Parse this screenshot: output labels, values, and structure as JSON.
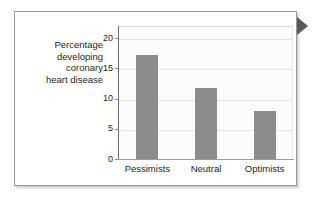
{
  "figure": {
    "caption_lines": "Percentage\ndeveloping\ncoronary\nheart disease",
    "pointer_marker": "play-triangle-icon"
  },
  "colors": {
    "bar_fill": "#8c8c8c",
    "frame_border": "#9a9a9a",
    "gridline": "#e4e4e4",
    "axis": "#6f6f6f",
    "text": "#231f20",
    "pointer": "#595959",
    "plot_background": "#fcfcfc"
  },
  "chart_data": {
    "type": "bar",
    "title": "",
    "subtitle": "",
    "xlabel": "",
    "ylabel": "Percentage developing coronary heart disease",
    "categories": [
      "Pessimists",
      "Neutral",
      "Optimists"
    ],
    "values": [
      17.2,
      11.7,
      7.9
    ],
    "ylim": [
      0,
      22
    ],
    "yticks": [
      0,
      5,
      10,
      15,
      20
    ],
    "ytick_labels": [
      "0",
      "5",
      "10",
      "15",
      "20"
    ],
    "grid": true,
    "grid_axis": "y",
    "legend": false,
    "legend_position": "none",
    "series": [
      {
        "name": "Percentage developing coronary heart disease",
        "values": [
          17.2,
          11.7,
          7.9
        ],
        "color": "#8c8c8c"
      }
    ],
    "annotations": []
  }
}
